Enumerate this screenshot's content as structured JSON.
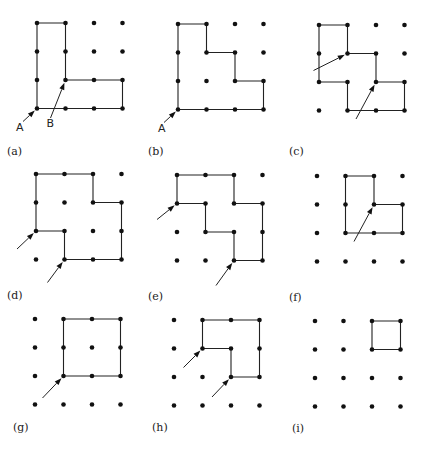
{
  "figure": {
    "spacing": 28.5,
    "dot_radius": 2.3,
    "panels": [
      {
        "id": "a",
        "caption": "(a)",
        "origin": [
          37,
          23
        ],
        "caption_pos": [
          7,
          155
        ],
        "path": [
          [
            0,
            0
          ],
          [
            1,
            0
          ],
          [
            1,
            2
          ],
          [
            3,
            2
          ],
          [
            3,
            3
          ],
          [
            0,
            3
          ]
        ],
        "arrows": [
          {
            "to": [
              0,
              3
            ],
            "from_offset": [
              -14,
              13
            ],
            "label": "A",
            "label_offset": [
              -21,
              22
            ]
          },
          {
            "to": [
              1,
              2
            ],
            "from_offset": [
              -15,
              38
            ],
            "label": "B",
            "label_offset": [
              -19,
              47
            ]
          }
        ]
      },
      {
        "id": "b",
        "caption": "(b)",
        "origin": [
          178,
          24
        ],
        "caption_pos": [
          148,
          155
        ],
        "path": [
          [
            0,
            0
          ],
          [
            1,
            0
          ],
          [
            1,
            1
          ],
          [
            2,
            1
          ],
          [
            2,
            2
          ],
          [
            3,
            2
          ],
          [
            3,
            3
          ],
          [
            0,
            3
          ]
        ],
        "arrows": [
          {
            "to": [
              0,
              3
            ],
            "from_offset": [
              -14,
              13
            ],
            "label": "A",
            "label_offset": [
              -20,
              22
            ]
          }
        ]
      },
      {
        "id": "c",
        "caption": "(c)",
        "origin": [
          319,
          25
        ],
        "caption_pos": [
          289,
          155
        ],
        "path": [
          [
            0,
            0
          ],
          [
            1,
            0
          ],
          [
            1,
            1
          ],
          [
            2,
            1
          ],
          [
            2,
            2
          ],
          [
            3,
            2
          ],
          [
            3,
            3
          ],
          [
            1,
            3
          ],
          [
            1,
            2
          ],
          [
            0,
            2
          ]
        ],
        "arrows": [
          {
            "to": [
              1,
              1
            ],
            "from_offset": [
              -34,
              17
            ],
            "label": ""
          },
          {
            "to": [
              2,
              2
            ],
            "from_offset": [
              -20,
              37
            ],
            "label": ""
          }
        ]
      },
      {
        "id": "d",
        "caption": "(d)",
        "origin": [
          36,
          174
        ],
        "caption_pos": [
          7,
          299
        ],
        "path": [
          [
            0,
            0
          ],
          [
            2,
            0
          ],
          [
            2,
            1
          ],
          [
            3,
            1
          ],
          [
            3,
            3
          ],
          [
            1,
            3
          ],
          [
            1,
            2
          ],
          [
            0,
            2
          ]
        ],
        "arrows": [
          {
            "to": [
              0,
              2
            ],
            "from_offset": [
              -19,
              18
            ],
            "label": ""
          },
          {
            "to": [
              1,
              3
            ],
            "from_offset": [
              -17,
              23
            ],
            "label": ""
          }
        ]
      },
      {
        "id": "e",
        "caption": "(e)",
        "origin": [
          177,
          175
        ],
        "caption_pos": [
          148,
          300
        ],
        "path": [
          [
            0,
            0
          ],
          [
            2,
            0
          ],
          [
            2,
            1
          ],
          [
            3,
            1
          ],
          [
            3,
            3
          ],
          [
            2,
            3
          ],
          [
            2,
            2
          ],
          [
            1,
            2
          ],
          [
            1,
            1
          ],
          [
            0,
            1
          ]
        ],
        "arrows": [
          {
            "to": [
              0,
              1
            ],
            "from_offset": [
              -20,
              16
            ],
            "label": ""
          },
          {
            "to": [
              2,
              3
            ],
            "from_offset": [
              -18,
              25
            ],
            "label": ""
          }
        ]
      },
      {
        "id": "f",
        "caption": "(f)",
        "origin": [
          317,
          176
        ],
        "caption_pos": [
          289,
          301
        ],
        "path": [
          [
            1,
            0
          ],
          [
            2,
            0
          ],
          [
            2,
            1
          ],
          [
            3,
            1
          ],
          [
            3,
            2
          ],
          [
            1,
            2
          ]
        ],
        "arrows": [
          {
            "to": [
              2,
              1
            ],
            "from_offset": [
              -20,
              37
            ],
            "label": ""
          }
        ]
      },
      {
        "id": "g",
        "caption": "(g)",
        "origin": [
          35,
          319
        ],
        "caption_pos": [
          13,
          431
        ],
        "path": [
          [
            1,
            0
          ],
          [
            3,
            0
          ],
          [
            3,
            2
          ],
          [
            1,
            2
          ]
        ],
        "arrows": [
          {
            "to": [
              1,
              2
            ],
            "from_offset": [
              -21,
              22
            ],
            "label": ""
          }
        ]
      },
      {
        "id": "h",
        "caption": "(h)",
        "origin": [
          174,
          320
        ],
        "caption_pos": [
          152,
          431
        ],
        "path": [
          [
            1,
            0
          ],
          [
            3,
            0
          ],
          [
            3,
            2
          ],
          [
            2,
            2
          ],
          [
            2,
            1
          ],
          [
            1,
            1
          ]
        ],
        "arrows": [
          {
            "to": [
              1,
              1
            ],
            "from_offset": [
              -19,
              19
            ],
            "label": ""
          },
          {
            "to": [
              2,
              2
            ],
            "from_offset": [
              -19,
              20
            ],
            "label": ""
          }
        ]
      },
      {
        "id": "i",
        "caption": "(i)",
        "origin": [
          315,
          321
        ],
        "caption_pos": [
          292,
          432
        ],
        "path": [
          [
            2,
            0
          ],
          [
            3,
            0
          ],
          [
            3,
            1
          ],
          [
            2,
            1
          ]
        ],
        "arrows": []
      }
    ]
  }
}
